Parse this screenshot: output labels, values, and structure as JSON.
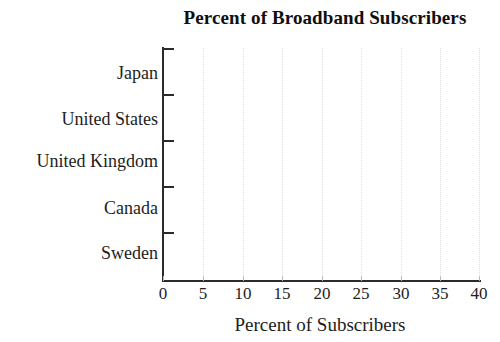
{
  "chart_data": {
    "type": "bar",
    "orientation": "horizontal",
    "title": "Percent of Broadband Subscribers",
    "xlabel": "Percent of Subscribers",
    "ylabel": "",
    "categories": [
      "Japan",
      "United States",
      "United Kingdom",
      "Canada",
      "Sweden"
    ],
    "values": [
      null,
      null,
      null,
      null,
      null
    ],
    "series": [
      {
        "name": "Percent of Subscribers",
        "values": [
          null,
          null,
          null,
          null,
          null
        ]
      }
    ],
    "xlim": [
      0,
      40
    ],
    "xticks": [
      0,
      5,
      10,
      15,
      20,
      25,
      30,
      35,
      40
    ],
    "xtick_labels": [
      "0",
      "5",
      "10",
      "15",
      "20",
      "25",
      "30",
      "35",
      "40"
    ],
    "grid": "vertical-dotted",
    "legend": "none",
    "note": "Blank axes template - no bars plotted",
    "colors": {
      "background": "#ffffff",
      "axis": "#2b2b2b",
      "gridline": "#dcdcdc",
      "text": "#1d1d1d",
      "title": "#100f0f"
    }
  }
}
